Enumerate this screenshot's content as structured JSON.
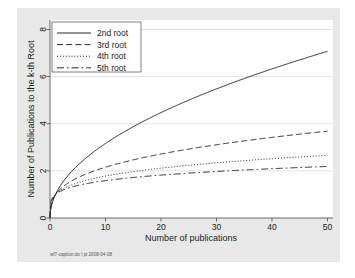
{
  "figure": {
    "background_color": "#e8e8e8",
    "plot_background_color": "#ffffff",
    "caption": "wf7-caption.do \\ pi 2008-04-08"
  },
  "chart_data": {
    "type": "line",
    "title": "",
    "xlabel": "Number of publications",
    "ylabel": "Number of Publications to the k-th Root",
    "xlim": [
      0,
      51
    ],
    "ylim": [
      0,
      8.4
    ],
    "xticks": [
      0,
      10,
      20,
      30,
      40,
      50
    ],
    "yticks": [
      0,
      2,
      4,
      6,
      8
    ],
    "grid": "horizontal",
    "legend_position": "top-left",
    "series": [
      {
        "name": "2nd root",
        "root": 2,
        "style": "solid",
        "color": "#1c1c1c",
        "x": [
          0,
          1,
          2,
          3,
          4,
          5,
          7,
          10,
          15,
          20,
          25,
          30,
          35,
          40,
          45,
          50
        ],
        "values": [
          0,
          1,
          1.41,
          1.73,
          2,
          2.24,
          2.65,
          3.16,
          3.87,
          4.47,
          5,
          5.48,
          5.92,
          6.32,
          6.71,
          7.07
        ]
      },
      {
        "name": "3rd root",
        "root": 3,
        "style": "dashed",
        "color": "#1c1c1c",
        "x": [
          0,
          1,
          2,
          3,
          4,
          5,
          7,
          10,
          15,
          20,
          25,
          30,
          35,
          40,
          45,
          50
        ],
        "values": [
          0,
          1,
          1.26,
          1.44,
          1.59,
          1.71,
          1.91,
          2.15,
          2.47,
          2.71,
          2.92,
          3.11,
          3.27,
          3.42,
          3.56,
          3.68
        ]
      },
      {
        "name": "4th root",
        "root": 4,
        "style": "dotted",
        "color": "#1c1c1c",
        "x": [
          0,
          1,
          2,
          3,
          4,
          5,
          7,
          10,
          15,
          20,
          25,
          30,
          35,
          40,
          45,
          50
        ],
        "values": [
          0,
          1,
          1.19,
          1.32,
          1.41,
          1.5,
          1.63,
          1.78,
          1.97,
          2.11,
          2.24,
          2.34,
          2.43,
          2.51,
          2.59,
          2.66
        ]
      },
      {
        "name": "5th root",
        "root": 5,
        "style": "dashdot",
        "color": "#1c1c1c",
        "x": [
          0,
          1,
          2,
          3,
          4,
          5,
          7,
          10,
          15,
          20,
          25,
          30,
          35,
          40,
          45,
          50
        ],
        "values": [
          0,
          1,
          1.15,
          1.25,
          1.32,
          1.38,
          1.48,
          1.58,
          1.72,
          1.82,
          1.9,
          1.97,
          2.03,
          2.09,
          2.14,
          2.19
        ]
      }
    ]
  }
}
